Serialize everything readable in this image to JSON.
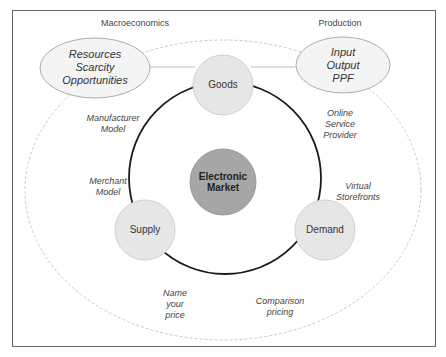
{
  "diagram": {
    "frame": {
      "border_color": "#666666"
    },
    "headers": {
      "left": "Macroeconomics",
      "right": "Production"
    },
    "ellipses": {
      "left": {
        "lines": [
          "Resources",
          "Scarcity",
          "Opportunities"
        ]
      },
      "right": {
        "lines": [
          "Input",
          "Output",
          "PPF"
        ]
      }
    },
    "nodes": {
      "goods": "Goods",
      "center": {
        "lines": [
          "Electronic",
          "Market"
        ]
      },
      "supply": "Supply",
      "demand": "Demand"
    },
    "annotations": {
      "manufacturer_model": {
        "lines": [
          "Manufacturer",
          "Model"
        ]
      },
      "merchant_model": {
        "lines": [
          "Merchant",
          "Model"
        ]
      },
      "online_service_provider": {
        "lines": [
          "Online",
          "Service",
          "Provider"
        ]
      },
      "virtual_storefronts": {
        "lines": [
          "Virtual",
          "Storefronts"
        ]
      },
      "name_your_price": {
        "lines": [
          "Name",
          "your",
          "price"
        ]
      },
      "comparison_pricing": {
        "lines": [
          "Comparison",
          "pricing"
        ]
      }
    },
    "colors": {
      "node_fill": "#e6e6e6",
      "node_stroke": "#cccccc",
      "center_fill": "#a6a6a6",
      "ring": "#1a1a1a",
      "dashed": "#bbbbbb",
      "ellipse_fill": "#f4f4f4",
      "ellipse_stroke": "#999999"
    }
  }
}
